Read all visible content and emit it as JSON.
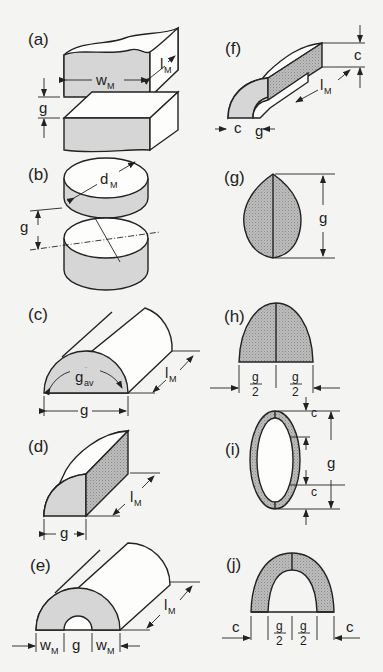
{
  "figure": {
    "background": "#f4f4f2",
    "fill_light": "#d6d6d6",
    "fill_hatched": "#b0b0b0",
    "panels": [
      {
        "id": "a",
        "label": "(a)",
        "shape": "parallel rectangular blocks",
        "dims": [
          "wM",
          "lM",
          "g"
        ]
      },
      {
        "id": "b",
        "label": "(b)",
        "shape": "parallel cylinders",
        "dims": [
          "dM",
          "g"
        ]
      },
      {
        "id": "c",
        "label": "(c)",
        "shape": "half cylinder",
        "dims": [
          "gav",
          "lM",
          "g"
        ]
      },
      {
        "id": "d",
        "label": "(d)",
        "shape": "quarter cylinder with block",
        "dims": [
          "lM",
          "g"
        ]
      },
      {
        "id": "e",
        "label": "(e)",
        "shape": "half annular cylinder",
        "dims": [
          "wM",
          "g",
          "wM",
          "lM"
        ]
      },
      {
        "id": "f",
        "label": "(f)",
        "shape": "quarter annulus with block",
        "dims": [
          "c",
          "lM",
          "c",
          "g"
        ]
      },
      {
        "id": "g",
        "label": "(g)",
        "shape": "lens cross-section",
        "dims": [
          "g"
        ]
      },
      {
        "id": "h",
        "label": "(h)",
        "shape": "half-lens cross-section",
        "dims": [
          "g/2",
          "g/2"
        ]
      },
      {
        "id": "i",
        "label": "(i)",
        "shape": "elliptical ring cross-section",
        "dims": [
          "c",
          "g",
          "c"
        ]
      },
      {
        "id": "j",
        "label": "(j)",
        "shape": "half elliptical ring cross-section",
        "dims": [
          "c",
          "g/2",
          "g/2",
          "c"
        ]
      }
    ]
  },
  "labels": {
    "a": "(a)",
    "b": "(b)",
    "c": "(c)",
    "d": "(d)",
    "e": "(e)",
    "f": "(f)",
    "g": "(g)",
    "h": "(h)",
    "i": "(i)",
    "j": "(j)"
  },
  "symbols": {
    "w": "w",
    "M": "M",
    "l": "l",
    "g": "g",
    "d": "d",
    "av": "av",
    "c": "c",
    "two": "2"
  }
}
